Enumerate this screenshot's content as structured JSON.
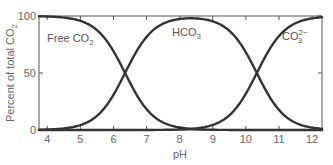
{
  "chart_data": {
    "type": "line",
    "title": "",
    "xlabel": "pH",
    "ylabel": "Percent of total CO2",
    "ylabel_base": "Percent of total CO",
    "ylabel_sub": "2",
    "xlim": [
      3.75,
      12.3
    ],
    "ylim": [
      0,
      100
    ],
    "xticks": [
      4,
      5,
      6,
      7,
      8,
      9,
      10,
      11,
      12
    ],
    "yticks": [
      0,
      50,
      100
    ],
    "grid": false,
    "legend": "inline labels",
    "pKa1": 6.35,
    "pKa2": 10.33,
    "x": [
      4,
      4.5,
      5,
      5.5,
      6,
      6.35,
      6.5,
      7,
      7.5,
      8,
      8.5,
      9,
      9.5,
      10,
      10.33,
      10.5,
      11,
      11.5,
      12
    ],
    "series": [
      {
        "name": "Free CO2",
        "label_base": "Free CO",
        "label_sub": "2",
        "label_sup": "",
        "values": [
          99.6,
          98.8,
          95.7,
          87.6,
          69.1,
          50.0,
          41.5,
          18.3,
          6.6,
          2.2,
          0.7,
          0.2,
          0.1,
          0.0,
          0.0,
          0.0,
          0.0,
          0.0,
          0.0
        ]
      },
      {
        "name": "HCO3-",
        "label_base": "HCO",
        "label_sub": "3",
        "label_sup": "",
        "values": [
          0.4,
          1.2,
          4.3,
          12.4,
          30.9,
          49.9,
          58.5,
          81.3,
          92.9,
          97.4,
          98.8,
          98.8,
          97.5,
          68.1,
          50.0,
          40.3,
          17.6,
          6.3,
          2.1
        ]
      },
      {
        "name": "CO3 2-",
        "label_base": "CO",
        "label_sub": "3",
        "label_sup": "2−",
        "values": [
          0.0,
          0.0,
          0.0,
          0.0,
          0.0,
          0.0,
          0.0,
          0.0,
          0.0,
          0.2,
          0.5,
          1.0,
          2.4,
          31.9,
          50.0,
          59.7,
          82.4,
          93.7,
          97.9
        ]
      }
    ],
    "line_color": "#333333"
  }
}
